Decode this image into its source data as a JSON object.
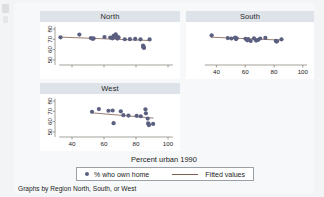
{
  "figure": {
    "x_axis_title": "Percent urban 1990",
    "caption": "Graphs by Region North, South, or West",
    "legend": {
      "marker_label": "% who own home",
      "line_label": "Fitted values"
    },
    "colors": {
      "marker": "#5b5f80",
      "fit_line": "#7d5d4e",
      "panel_title_bar": "#dde3e9",
      "page_background": "#f3f4f6",
      "plot_background": "#ffffff",
      "axis": "#6a6257"
    }
  },
  "chart_data": {
    "type": "scatter",
    "title": "",
    "subtitle": "",
    "xlabel": "Percent urban 1990",
    "ylabel": "% who own home",
    "grid": false,
    "legend_position": "bottom",
    "xlim": [
      30,
      105
    ],
    "ylim": [
      45,
      83
    ],
    "xticks": [
      40,
      60,
      80,
      100
    ],
    "yticks": [
      50,
      60,
      70,
      80
    ],
    "panels": [
      {
        "name": "North",
        "x_tick_labels_shown": false,
        "y_tick_labels_shown": true,
        "points": [
          {
            "x": 32.8,
            "y": 72.0
          },
          {
            "x": 44.6,
            "y": 74.6
          },
          {
            "x": 51.8,
            "y": 71.2
          },
          {
            "x": 52.9,
            "y": 70.5
          },
          {
            "x": 53.5,
            "y": 70.9
          },
          {
            "x": 60.3,
            "y": 72.3
          },
          {
            "x": 63.9,
            "y": 71.8
          },
          {
            "x": 65.2,
            "y": 71.0
          },
          {
            "x": 66.0,
            "y": 73.5
          },
          {
            "x": 66.6,
            "y": 72.4
          },
          {
            "x": 67.3,
            "y": 74.9
          },
          {
            "x": 67.9,
            "y": 73.0
          },
          {
            "x": 68.4,
            "y": 70.7
          },
          {
            "x": 69.1,
            "y": 71.9
          },
          {
            "x": 73.0,
            "y": 70.1
          },
          {
            "x": 76.2,
            "y": 70.2
          },
          {
            "x": 79.5,
            "y": 70.4
          },
          {
            "x": 82.8,
            "y": 70.0
          },
          {
            "x": 84.4,
            "y": 64.0
          },
          {
            "x": 84.6,
            "y": 62.3
          },
          {
            "x": 84.8,
            "y": 62.8
          },
          {
            "x": 85.0,
            "y": 61.6
          },
          {
            "x": 88.5,
            "y": 69.9
          }
        ],
        "fit": {
          "x1": 32.0,
          "y1": 72.2,
          "x2": 89.5,
          "y2": 68.8
        }
      },
      {
        "name": "South",
        "x_tick_labels_shown": true,
        "y_tick_labels_shown": false,
        "points": [
          {
            "x": 36.7,
            "y": 73.9
          },
          {
            "x": 47.9,
            "y": 71.2
          },
          {
            "x": 50.4,
            "y": 70.8
          },
          {
            "x": 53.0,
            "y": 71.6
          },
          {
            "x": 53.6,
            "y": 70.3
          },
          {
            "x": 54.1,
            "y": 71.0
          },
          {
            "x": 60.2,
            "y": 70.6
          },
          {
            "x": 61.4,
            "y": 69.0
          },
          {
            "x": 62.1,
            "y": 70.2
          },
          {
            "x": 63.8,
            "y": 68.4
          },
          {
            "x": 66.1,
            "y": 70.9
          },
          {
            "x": 67.6,
            "y": 68.8
          },
          {
            "x": 68.9,
            "y": 69.4
          },
          {
            "x": 70.4,
            "y": 70.8
          },
          {
            "x": 74.0,
            "y": 71.4
          },
          {
            "x": 81.3,
            "y": 68.6
          },
          {
            "x": 81.7,
            "y": 67.8
          },
          {
            "x": 82.1,
            "y": 68.2
          },
          {
            "x": 85.2,
            "y": 70.0
          }
        ],
        "fit": {
          "x1": 36.0,
          "y1": 72.1,
          "x2": 86.0,
          "y2": 69.2
        }
      },
      {
        "name": "West",
        "x_tick_labels_shown": true,
        "y_tick_labels_shown": true,
        "points": [
          {
            "x": 52.5,
            "y": 69.6
          },
          {
            "x": 56.8,
            "y": 72.2
          },
          {
            "x": 62.8,
            "y": 70.6
          },
          {
            "x": 65.4,
            "y": 70.8
          },
          {
            "x": 66.0,
            "y": 58.5
          },
          {
            "x": 70.5,
            "y": 70.0
          },
          {
            "x": 72.1,
            "y": 66.3
          },
          {
            "x": 75.3,
            "y": 65.9
          },
          {
            "x": 80.4,
            "y": 65.6
          },
          {
            "x": 83.0,
            "y": 65.2
          },
          {
            "x": 85.9,
            "y": 72.0
          },
          {
            "x": 86.2,
            "y": 68.1
          },
          {
            "x": 87.3,
            "y": 63.0
          },
          {
            "x": 87.6,
            "y": 58.4
          },
          {
            "x": 87.9,
            "y": 57.3
          },
          {
            "x": 88.1,
            "y": 56.6
          },
          {
            "x": 90.7,
            "y": 57.7
          }
        ],
        "fit": {
          "x1": 52.0,
          "y1": 68.6,
          "x2": 91.0,
          "y2": 63.4
        }
      }
    ]
  }
}
